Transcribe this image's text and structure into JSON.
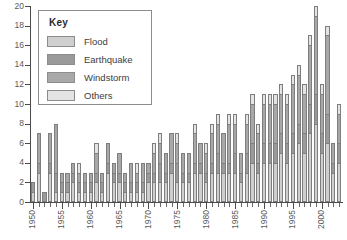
{
  "chart_data": {
    "type": "bar",
    "stacked": true,
    "title": "",
    "subtitle": "",
    "xlabel": "",
    "ylabel": "",
    "ylim": [
      0,
      20
    ],
    "ytick_values": [
      0,
      2,
      4,
      6,
      8,
      10,
      12,
      14,
      16,
      18,
      20
    ],
    "ytick_labels": [
      "0",
      "2",
      "4",
      "6",
      "8",
      "10",
      "12",
      "14",
      "16",
      "18",
      "20"
    ],
    "grid": false,
    "xlim": [
      1950,
      2003
    ],
    "x_major_labels": [
      "1950",
      "1955",
      "1960",
      "1965",
      "1970",
      "1975",
      "1980",
      "1985",
      "1990",
      "1995",
      "2000"
    ],
    "x_major_values": [
      1950,
      1955,
      1960,
      1965,
      1970,
      1975,
      1980,
      1985,
      1990,
      1995,
      2000
    ],
    "legend": {
      "title": "Key",
      "position": "upper-left-inset",
      "entries": [
        {
          "name": "Flood",
          "color": "#cfcfcf"
        },
        {
          "name": "Earthquake",
          "color": "#9a9a9a"
        },
        {
          "name": "Windstorm",
          "color": "#a8a8a8"
        },
        {
          "name": "Others",
          "color": "#e4e4e4"
        }
      ]
    },
    "categories": [
      1950,
      1951,
      1952,
      1953,
      1954,
      1955,
      1956,
      1957,
      1958,
      1959,
      1960,
      1961,
      1962,
      1963,
      1964,
      1965,
      1966,
      1967,
      1968,
      1969,
      1970,
      1971,
      1972,
      1973,
      1974,
      1975,
      1976,
      1977,
      1978,
      1979,
      1980,
      1981,
      1982,
      1983,
      1984,
      1985,
      1986,
      1987,
      1988,
      1989,
      1990,
      1991,
      1992,
      1993,
      1994,
      1995,
      1996,
      1997,
      1998,
      1999,
      2000,
      2001,
      2002,
      2003
    ],
    "series": [
      {
        "name": "Flood",
        "color": "#cfcfcf",
        "values": [
          1,
          3,
          0,
          3,
          1,
          1,
          1,
          2,
          1,
          1,
          1,
          2,
          1,
          3,
          2,
          2,
          1,
          1,
          1,
          1,
          2,
          2,
          2,
          2,
          3,
          2,
          2,
          2,
          3,
          3,
          2,
          3,
          3,
          3,
          3,
          3,
          2,
          3,
          4,
          3,
          4,
          4,
          4,
          5,
          4,
          5,
          6,
          5,
          7,
          8,
          5,
          6,
          3,
          4
        ]
      },
      {
        "name": "Earthquake",
        "color": "#9a9a9a",
        "values": [
          1,
          1,
          1,
          1,
          2,
          1,
          1,
          1,
          1,
          1,
          1,
          1,
          1,
          1,
          1,
          1,
          1,
          1,
          1,
          1,
          1,
          1,
          2,
          1,
          1,
          2,
          1,
          1,
          1,
          1,
          1,
          1,
          2,
          1,
          1,
          2,
          1,
          2,
          2,
          1,
          2,
          2,
          2,
          2,
          2,
          2,
          2,
          2,
          3,
          3,
          2,
          3,
          1,
          2
        ]
      },
      {
        "name": "Windstorm",
        "color": "#a8a8a8",
        "values": [
          0,
          3,
          0,
          3,
          5,
          1,
          1,
          1,
          1,
          1,
          1,
          2,
          1,
          2,
          1,
          2,
          1,
          2,
          1,
          2,
          1,
          2,
          2,
          2,
          3,
          2,
          2,
          2,
          3,
          2,
          2,
          3,
          3,
          3,
          4,
          3,
          2,
          3,
          4,
          3,
          4,
          4,
          4,
          4,
          4,
          5,
          5,
          4,
          6,
          8,
          4,
          8,
          2,
          3
        ]
      },
      {
        "name": "Others",
        "color": "#e4e4e4",
        "values": [
          0,
          0,
          0,
          0,
          0,
          0,
          0,
          0,
          1,
          0,
          0,
          1,
          0,
          0,
          0,
          0,
          0,
          0,
          1,
          0,
          0,
          1,
          1,
          0,
          0,
          1,
          0,
          0,
          1,
          0,
          1,
          1,
          1,
          0,
          1,
          1,
          0,
          1,
          1,
          1,
          1,
          1,
          1,
          1,
          1,
          1,
          1,
          1,
          1,
          1,
          1,
          1,
          0,
          1
        ]
      }
    ],
    "totals": [
      2,
      7,
      1,
      7,
      8,
      3,
      3,
      4,
      4,
      3,
      3,
      6,
      3,
      6,
      4,
      5,
      3,
      4,
      4,
      4,
      4,
      6,
      7,
      5,
      7,
      7,
      5,
      5,
      8,
      6,
      6,
      8,
      9,
      7,
      9,
      9,
      5,
      9,
      11,
      8,
      11,
      11,
      11,
      12,
      11,
      13,
      14,
      12,
      17,
      20,
      12,
      18,
      6,
      10
    ]
  }
}
